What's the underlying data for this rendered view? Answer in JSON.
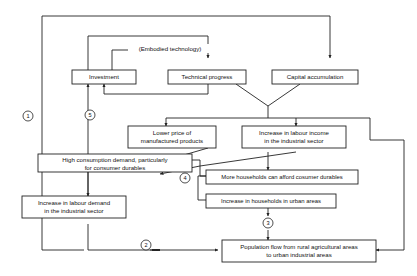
{
  "diagram": {
    "background_color": "#ffffff",
    "line_color": "#222222",
    "text_color": "#111111",
    "nodes": [
      {
        "id": "investment",
        "label": "Investment"
      },
      {
        "id": "technical_progress",
        "label": "Technical progress"
      },
      {
        "id": "capital_accumulation",
        "label": "Capital accumulation"
      },
      {
        "id": "lower_price",
        "label_line1": "Lower price of",
        "label_line2": "manufactured products"
      },
      {
        "id": "labour_income",
        "label_line1": "Increase in labour income",
        "label_line2": "in the industrial sector"
      },
      {
        "id": "high_consumption",
        "label_line1": "High consumption demand, particularly",
        "label_line2": "for consumer durables"
      },
      {
        "id": "more_households",
        "label": "More households can afford cosumer durables"
      },
      {
        "id": "urban_households",
        "label": "Increase in households in urban areas"
      },
      {
        "id": "labour_demand",
        "label_line1": "Increase in labour demand",
        "label_line2": "in the industrial sector"
      },
      {
        "id": "population_flow",
        "label_line1": "Population flow from rural agricultural areas",
        "label_line2": "to urban industrial areas"
      }
    ],
    "annotations": [
      {
        "id": "embodied_technology",
        "label": "(Embodied technology)"
      }
    ],
    "markers": [
      {
        "id": "marker-1",
        "label": "1"
      },
      {
        "id": "marker-2",
        "label": "2"
      },
      {
        "id": "marker-3",
        "label": "3"
      },
      {
        "id": "marker-4",
        "label": "4"
      },
      {
        "id": "marker-5",
        "label": "5"
      }
    ]
  }
}
